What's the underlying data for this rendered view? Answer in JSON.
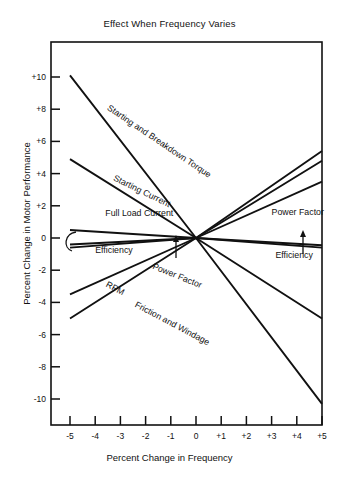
{
  "chart_data": {
    "type": "line",
    "title": "Effect When Frequency Varies",
    "xlabel": "Percent Change in Frequency",
    "ylabel": "Percent Change in Motor Performance",
    "xlim": [
      -5,
      5
    ],
    "ylim": [
      -11,
      11
    ],
    "xticks": [
      "-5",
      "-4",
      "-3",
      "-2",
      "-1",
      "0",
      "+1",
      "+2",
      "+3",
      "+4",
      "+5"
    ],
    "xtick_values": [
      -5,
      -4,
      -3,
      -2,
      -1,
      0,
      1,
      2,
      3,
      4,
      5
    ],
    "yticks": [
      "+10",
      "+8",
      "+6",
      "+4",
      "+2",
      "0",
      "-2",
      "-4",
      "-6",
      "-8",
      "-10"
    ],
    "ytick_values": [
      10,
      8,
      6,
      4,
      2,
      0,
      -2,
      -4,
      -6,
      -8,
      -10
    ],
    "grid": false,
    "legend": "inline-curve-labels",
    "x": [
      -5,
      0,
      5
    ],
    "series": [
      {
        "name": "Starting and Breakdown Torque",
        "values": [
          10.1,
          0,
          -10.3
        ],
        "label": "Starting and Breakdown Torque",
        "label_x": -3.55,
        "label_y": 8.0,
        "label_angle": 34
      },
      {
        "name": "Starting Current",
        "values": [
          4.9,
          0,
          -5.0
        ],
        "label": "Starting Current",
        "label_x": -3.3,
        "label_y": 3.6,
        "label_angle": 26
      },
      {
        "name": "Full Load Current",
        "values": [
          0.5,
          0,
          -0.6
        ],
        "label": "Full Load Current",
        "label_x": -3.6,
        "label_y": 1.35,
        "label_angle": 0
      },
      {
        "name": "Efficiency",
        "values": [
          -0.4,
          0,
          -0.45
        ],
        "label": "Efficiency",
        "label_x": -4.0,
        "label_y": -0.95,
        "label_angle": 0
      },
      {
        "name": "Power Factor",
        "values": [
          -0.6,
          0,
          4.8
        ],
        "label": "Power Factor",
        "label_x": -1.75,
        "label_y": -1.9,
        "label_angle": 22
      },
      {
        "name": "RPM",
        "values": [
          -3.5,
          0,
          3.5
        ],
        "label": "RPM",
        "label_x": -3.6,
        "label_y": -3.0,
        "label_angle": 28
      },
      {
        "name": "Friction and Windage",
        "values": [
          -5.0,
          0,
          5.4
        ],
        "label": "Friction and Windage",
        "label_x": -2.45,
        "label_y": -4.25,
        "label_angle": 28
      }
    ],
    "right_labels": [
      {
        "label": "Power Factor",
        "x": 3.0,
        "y": 1.4
      },
      {
        "label": "Efficiency",
        "x": 3.15,
        "y": -1.25
      }
    ],
    "annotations": [
      {
        "name": "power-factor-leader-arrow",
        "type": "arrow-up"
      },
      {
        "name": "efficiency-leader-arrow",
        "type": "arrow-up"
      },
      {
        "name": "efficiency-leader-arc",
        "type": "arc"
      }
    ]
  }
}
